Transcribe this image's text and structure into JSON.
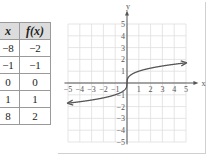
{
  "table": {
    "headers": [
      "x",
      "f(x)"
    ],
    "rows": [
      [
        "−8",
        "−2"
      ],
      [
        "−1",
        "−1"
      ],
      [
        "0",
        "0"
      ],
      [
        "1",
        "1"
      ],
      [
        "8",
        "2"
      ]
    ]
  },
  "graph": {
    "x_axis_label": "x",
    "y_axis_label": "y",
    "x_ticks": [
      "−5",
      "−4",
      "−3",
      "−2",
      "−1",
      "1",
      "2",
      "3",
      "4",
      "5"
    ],
    "y_ticks": [
      "5",
      "4",
      "3",
      "2",
      "1",
      "−1",
      "−2",
      "−3",
      "−4",
      "−5"
    ]
  },
  "chart_data": {
    "type": "line",
    "title": "",
    "function": "f(x) = cube root of x",
    "xlabel": "x",
    "ylabel": "y",
    "xlim": [
      -5,
      5
    ],
    "ylim": [
      -5,
      5
    ],
    "grid": true,
    "x": [
      -5,
      -4,
      -3,
      -2,
      -1,
      -0.5,
      0,
      0.5,
      1,
      2,
      3,
      4,
      5
    ],
    "series": [
      {
        "name": "f(x)",
        "values": [
          -1.71,
          -1.59,
          -1.44,
          -1.26,
          -1,
          -0.79,
          0,
          0.79,
          1,
          1.26,
          1.44,
          1.59,
          1.71
        ]
      }
    ],
    "table": {
      "x": [
        -8,
        -1,
        0,
        1,
        8
      ],
      "f(x)": [
        -2,
        -1,
        0,
        1,
        2
      ]
    }
  }
}
